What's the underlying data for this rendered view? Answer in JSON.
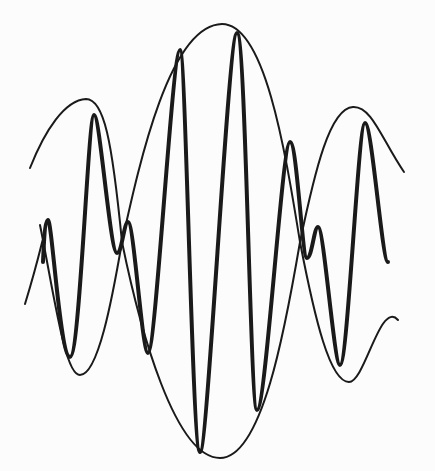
{
  "diagram": {
    "type": "amplitude-modulated-wave",
    "labels": [],
    "background": "#fcfcfc",
    "stroke_color": "#1a1a1a",
    "envelope": {
      "description": "thin sinusoidal envelope curves (upper and lower) forming three lobes",
      "upper_peaks": [
        [
          88,
          100
        ],
        [
          222,
          24
        ],
        [
          355,
          108
        ]
      ],
      "lower_troughs": [
        [
          80,
          375
        ],
        [
          220,
          458
        ],
        [
          349,
          382
        ]
      ],
      "crossings": [
        [
          40,
          225
        ],
        [
          122,
          242
        ],
        [
          300,
          242
        ],
        [
          388,
          248
        ]
      ]
    },
    "carrier": {
      "description": "thick high-frequency oscillation bounded by envelope",
      "points": [
        [
          43,
          262
        ],
        [
          48,
          220
        ],
        [
          70,
          357
        ],
        [
          94,
          115
        ],
        [
          117,
          253
        ],
        [
          128,
          222
        ],
        [
          148,
          353
        ],
        [
          180,
          50
        ],
        [
          200,
          452
        ],
        [
          237,
          33
        ],
        [
          257,
          410
        ],
        [
          290,
          142
        ],
        [
          307,
          258
        ],
        [
          318,
          227
        ],
        [
          340,
          365
        ],
        [
          365,
          123
        ],
        [
          388,
          262
        ]
      ]
    }
  }
}
